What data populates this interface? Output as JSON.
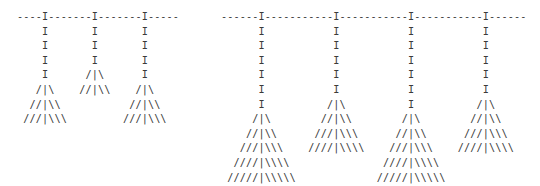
{
  "figures": [
    {
      "id": "left",
      "description": "ASCII rail with 3 hanging stems and brooms",
      "lines": [
        "----I-------I-------I-----",
        "    I       I       I",
        "    I       I       I",
        "    I       I       I",
        "    I      /|\\      I",
        "   /|\\    //|\\\\    /|\\",
        "  //|\\\\           //|\\\\",
        " ///|\\\\\\         ///|\\\\\\"
      ]
    },
    {
      "id": "right",
      "description": "ASCII rail with 4 hanging stems and brooms",
      "lines": [
        "------I-----------I-----------I-----------I------",
        "      I           I           I           I",
        "      I           I           I           I",
        "      I           I           I           I",
        "      I           I           I           I",
        "      I           I           I           I",
        "      I          /|\\          I          /|\\",
        "     /|\\        //|\\\\        /|\\        //|\\\\",
        "    //|\\\\      ///|\\\\\\      //|\\\\      ///|\\\\\\",
        "   ///|\\\\\\    ////|\\\\\\\\    ///|\\\\\\    ////|\\\\\\\\",
        "  ////|\\\\\\\\               ////|\\\\\\\\",
        " /////|\\\\\\\\\\             /////|\\\\\\\\\\"
      ]
    }
  ],
  "colors": {
    "text": "#3a3a3a",
    "background": "#ffffff"
  }
}
